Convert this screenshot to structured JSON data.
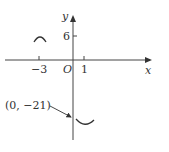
{
  "diagram": {
    "axes": {
      "x_label": "x",
      "y_label": "y",
      "origin_label": "O"
    },
    "ticks": {
      "x_neg": "−3",
      "x_pos": "1",
      "y_pos": "6"
    },
    "annotation": {
      "point_label": "(0, −21)"
    },
    "curves": [
      {
        "name": "local-max-near-x-neg3",
        "shape": "cap"
      },
      {
        "name": "local-min-near-y-neg21",
        "shape": "cup"
      }
    ],
    "color": "#333333"
  }
}
